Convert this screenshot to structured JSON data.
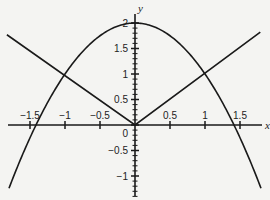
{
  "chart_data": {
    "type": "line",
    "title": "",
    "xlabel": "x",
    "ylabel": "y",
    "xlim": [
      -1.9,
      1.82
    ],
    "ylim": [
      -1.4,
      2.2
    ],
    "grid": false,
    "legend": null,
    "x_ticks": [
      -1.5,
      -1,
      -0.5,
      0.5,
      1,
      1.5
    ],
    "x_tick_labels": [
      "-1.5",
      "-1",
      "-0.5",
      "0.5",
      "1",
      "1.5"
    ],
    "y_ticks": [
      -1,
      -0.5,
      0,
      0.5,
      1,
      1.5,
      2
    ],
    "y_tick_labels": [
      "-1",
      "-0.5",
      "0",
      "0.5",
      "1",
      "1.5",
      "2"
    ],
    "series": [
      {
        "name": "parabola",
        "expression": "y = 2 - x^2",
        "x": [
          -1.8,
          -1.5,
          -1.0,
          -0.5,
          0,
          0.5,
          1.0,
          1.5,
          1.81
        ],
        "y": [
          -1.24,
          -0.25,
          1.0,
          1.75,
          2.0,
          1.75,
          1.0,
          -0.25,
          -1.28
        ]
      },
      {
        "name": "absolute-value",
        "expression": "y = |x|",
        "x": [
          -1.83,
          0,
          1.79
        ],
        "y": [
          1.77,
          0,
          1.82
        ]
      }
    ],
    "intersections": [
      [
        -1,
        1
      ],
      [
        1,
        1
      ]
    ]
  },
  "labels": {
    "x_axis": "x",
    "y_axis": "y",
    "origin": "0"
  }
}
